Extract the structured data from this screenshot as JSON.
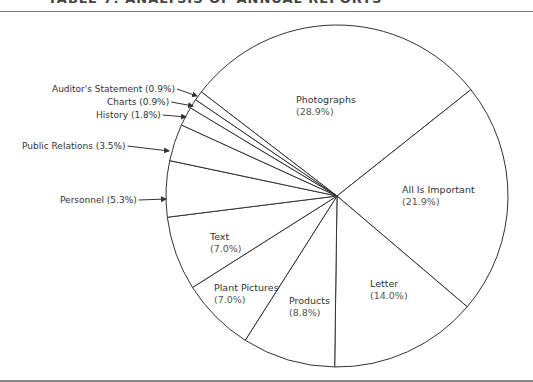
{
  "header": {
    "title": "TABLE 7: ANALYSIS OF ANNUAL REPORTS"
  },
  "chart_data": {
    "type": "pie",
    "title": "",
    "start_angle_deg": 307.5,
    "direction": "clockwise",
    "center": [
      337,
      196
    ],
    "radius": 171,
    "slices": [
      {
        "label": "Photographs",
        "value": 28.9,
        "pct_text": "(28.9%)",
        "label_pos": [
          296,
          103
        ],
        "external": false
      },
      {
        "label": "All Is Important",
        "value": 21.9,
        "pct_text": "(21.9%)",
        "label_pos": [
          402,
          193
        ],
        "external": false
      },
      {
        "label": "Letter",
        "value": 14.0,
        "pct_text": "(14.0%)",
        "label_pos": [
          370,
          287
        ],
        "external": false
      },
      {
        "label": "Products",
        "value": 8.8,
        "pct_text": "(8.8%)",
        "label_pos": [
          289,
          304
        ],
        "external": false
      },
      {
        "label": "Plant Pictures",
        "value": 7.0,
        "pct_text": "(7.0%)",
        "label_pos": [
          214,
          291
        ],
        "external": false
      },
      {
        "label": "Text",
        "value": 7.0,
        "pct_text": "(7.0%)",
        "label_pos": [
          210,
          240
        ],
        "external": false
      },
      {
        "label": "Personnel",
        "value": 5.3,
        "pct_text": "(5.3%)",
        "label_pos": [
          60,
          203
        ],
        "arrow_to": [
          166,
          199
        ],
        "external": true,
        "dashed_boundary": true
      },
      {
        "label": "Public Relations",
        "value": 3.5,
        "pct_text": "(3.5%)",
        "label_pos": [
          22,
          149
        ],
        "arrow_to": [
          169,
          151
        ],
        "external": true
      },
      {
        "label": "History",
        "value": 1.8,
        "pct_text": "(1.8%)",
        "label_pos": [
          96,
          118
        ],
        "arrow_to": [
          186,
          117
        ],
        "external": true
      },
      {
        "label": "Charts",
        "value": 0.9,
        "pct_text": "(0.9%)",
        "label_pos": [
          107,
          105
        ],
        "arrow_to": [
          193,
          106
        ],
        "external": true
      },
      {
        "label": "Auditor's Statement",
        "value": 0.9,
        "pct_text": "(0.9%)",
        "label_pos": [
          52,
          92
        ],
        "arrow_to": [
          197,
          96
        ],
        "external": true
      }
    ],
    "legend": "none",
    "colors": {
      "stroke": "#333333",
      "fill": "#ffffff",
      "text": "#333333"
    }
  }
}
